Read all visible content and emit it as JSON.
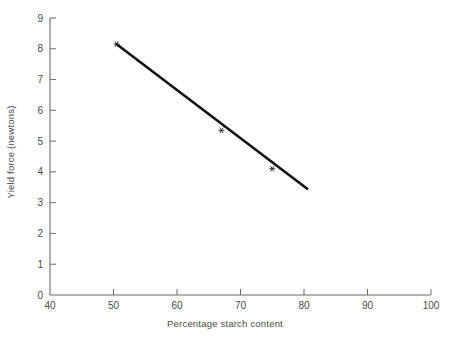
{
  "chart_data": {
    "type": "scatter",
    "title": "",
    "xlabel": "Percentage starch content",
    "ylabel": "Yield force (newtons)",
    "xlim": [
      40,
      100
    ],
    "ylim": [
      0,
      9
    ],
    "xticks": [
      40,
      50,
      60,
      70,
      80,
      90,
      100
    ],
    "yticks": [
      0,
      1,
      2,
      3,
      4,
      5,
      6,
      7,
      8,
      9
    ],
    "grid": false,
    "legend": null,
    "tick_direction": "in",
    "series": [
      {
        "name": "Observed data points",
        "marker": "asterisk",
        "x": [
          50.5,
          67.0,
          75.0
        ],
        "y": [
          8.15,
          5.35,
          4.1
        ]
      },
      {
        "name": "Fitted regression line",
        "marker": "none",
        "style": "solid",
        "x": [
          50.5,
          80.5
        ],
        "y": [
          8.15,
          3.45
        ]
      }
    ],
    "annotations": []
  },
  "axes": {
    "y_tick_labels": [
      "0",
      "1",
      "2",
      "3",
      "4",
      "5",
      "6",
      "7",
      "8",
      "9"
    ],
    "x_tick_labels": [
      "40",
      "50",
      "60",
      "70",
      "80",
      "90",
      "100"
    ],
    "x_axis_title": "Percentage starch content",
    "y_axis_title": "Yield force (newtons)"
  },
  "colors": {
    "background": "#ffffff",
    "axis": "#6b6b6b",
    "text": "#4a4a4a",
    "line": "#121212",
    "marker": "#1a1a1a"
  }
}
